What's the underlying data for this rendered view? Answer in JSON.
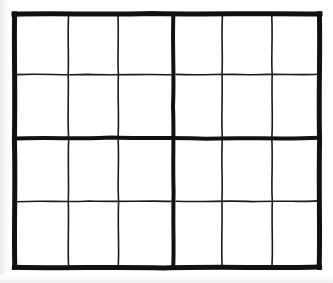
{
  "figure": {
    "kind": "hand-drawn-grid-diagram",
    "background_color": "#ffffff",
    "ink_color": "#111111",
    "thin_ink_color": "#1a1a1a",
    "canvas": {
      "width": 333,
      "height": 283
    },
    "blocks": {
      "columns": 2,
      "rows": 2,
      "total": 4
    },
    "cells_per_block": {
      "columns": 3,
      "rows": 2,
      "total": 6
    },
    "cells_total": 24,
    "stroke_widths": {
      "outer_border": 5,
      "block_divider": 4,
      "cell_line": 1.6
    },
    "frame": {
      "left": 15,
      "top": 14,
      "right": 319,
      "bottom": 267
    },
    "thick_vertical_x": [
      15,
      173,
      319
    ],
    "thick_horizontal_y": [
      14,
      138,
      267
    ],
    "thin_vertical_x": [
      68,
      119,
      222,
      272
    ],
    "thin_horizontal_y": [
      75,
      201
    ],
    "labels": {
      "diagram_title": "",
      "caption": ""
    }
  },
  "chart_data": {
    "type": "table",
    "title": "",
    "xlabel": "",
    "ylabel": "",
    "grid": true,
    "columns": [
      "",
      "",
      "",
      "",
      "",
      ""
    ],
    "rows": [
      [
        "",
        "",
        "",
        "",
        "",
        ""
      ],
      [
        "",
        "",
        "",
        "",
        "",
        ""
      ],
      [
        "",
        "",
        "",
        "",
        "",
        ""
      ],
      [
        "",
        "",
        "",
        "",
        "",
        ""
      ]
    ]
  }
}
